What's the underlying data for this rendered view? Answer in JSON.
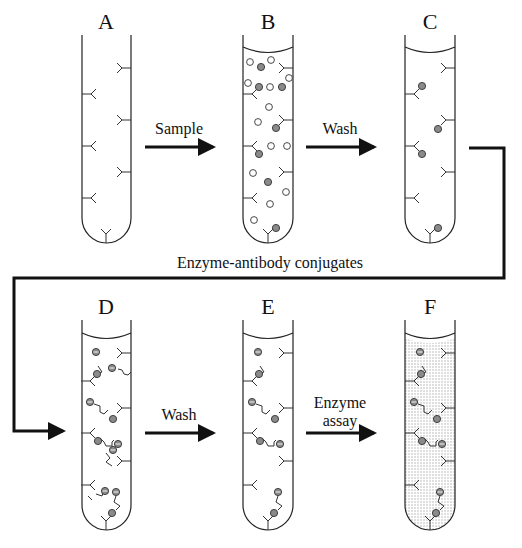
{
  "diagram": {
    "tubes": [
      {
        "id": "A",
        "label": "A",
        "cx": 106,
        "row": "top",
        "meniscus": false,
        "stippled": false
      },
      {
        "id": "B",
        "label": "B",
        "cx": 268,
        "row": "top",
        "meniscus": true,
        "stippled": false
      },
      {
        "id": "C",
        "label": "C",
        "cx": 430,
        "row": "top",
        "meniscus": true,
        "stippled": false
      },
      {
        "id": "D",
        "label": "D",
        "cx": 106,
        "row": "bottom",
        "meniscus": true,
        "stippled": false
      },
      {
        "id": "E",
        "label": "E",
        "cx": 268,
        "row": "bottom",
        "meniscus": true,
        "stippled": false
      },
      {
        "id": "F",
        "label": "F",
        "cx": 430,
        "row": "bottom",
        "meniscus": true,
        "stippled": true
      }
    ],
    "steps": [
      {
        "id": "sample",
        "label": "Sample",
        "from": "A",
        "to": "B"
      },
      {
        "id": "wash1",
        "label": "Wash",
        "from": "B",
        "to": "C"
      },
      {
        "id": "conjugates",
        "label": "Enzyme-antibody conjugates",
        "from": "C",
        "to": "D"
      },
      {
        "id": "wash2",
        "label": "Wash",
        "from": "D",
        "to": "E"
      },
      {
        "id": "assay",
        "label_line1": "Enzyme",
        "label_line2": "assay",
        "from": "E",
        "to": "F"
      }
    ],
    "legend_glyphs": {
      "antibody": "Y-shaped capture antibody",
      "antigen": "grey filled circle",
      "other_molecule": "open circle",
      "enzyme": "e-labelled circle"
    },
    "colors": {
      "line": "#111111",
      "antigen_fill": "#8a8a8a",
      "stipple": "#b9b9b9",
      "background": "#ffffff"
    }
  }
}
